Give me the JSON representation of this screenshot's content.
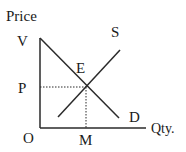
{
  "diagram": {
    "type": "supply-demand",
    "axes": {
      "y_label": "Price",
      "x_label": "Qty.",
      "origin_label": "O"
    },
    "curves": {
      "demand_label": "D",
      "supply_label": "S",
      "demand_intercept_label": "V"
    },
    "equilibrium": {
      "point_label": "E",
      "price_label": "P",
      "quantity_label": "M"
    },
    "colors": {
      "line": "#2a2a2a",
      "text": "#1a1a1a"
    }
  }
}
